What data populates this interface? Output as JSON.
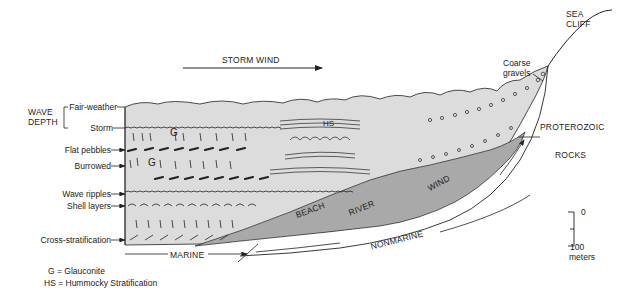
{
  "title_arrow": {
    "label": "STORM WIND"
  },
  "wave_depth": {
    "group_label": [
      "WAVE",
      "DEPTH"
    ],
    "levels": [
      "Fair-weather",
      "Storm"
    ]
  },
  "left_labels": [
    "Flat pebbles",
    "Burrowed",
    "Wave ripples",
    "Shell layers",
    "Cross-stratification"
  ],
  "in_diagram_labels": {
    "glauconite_1": "G",
    "glauconite_2": "G",
    "hummocky": "HS",
    "beach": "BEACH",
    "river": "RIVER",
    "wind": "WIND"
  },
  "environment_labels": {
    "marine": "MARINE",
    "nonmarine": "NONMARINE"
  },
  "right_labels": {
    "sea_cliff": [
      "SEA",
      "CLIFF"
    ],
    "coarse_gravels": [
      "Coarse",
      "gravels"
    ],
    "proterozoic": "PROTEROZOIC",
    "rocks": "ROCKS"
  },
  "scale_bar": {
    "top": "0",
    "bottom": "100",
    "unit": "meters"
  },
  "legend": [
    "G = Glauconite",
    "HS = Hummocky Stratification"
  ],
  "colors": {
    "marine_fill": "#dcdcdc",
    "nonmarine_fill": "#a9a9a9",
    "line": "#222222"
  }
}
